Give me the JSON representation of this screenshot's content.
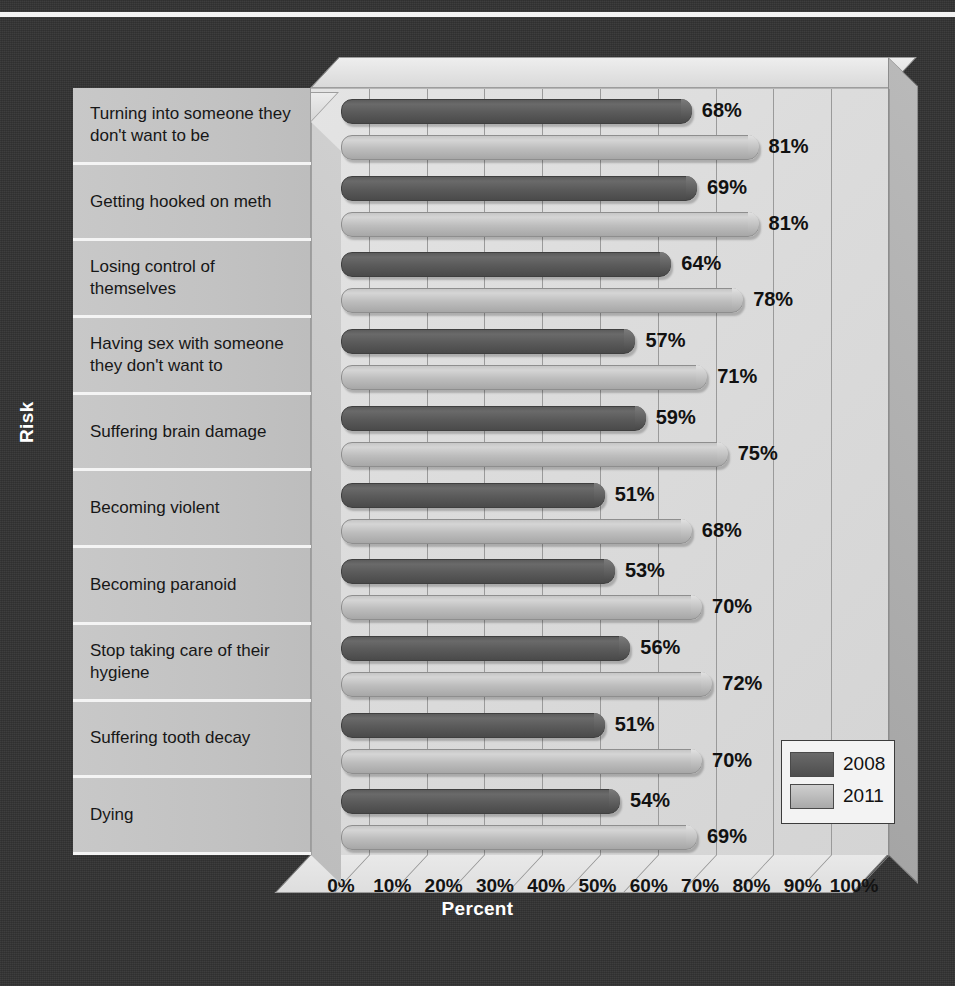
{
  "title": "",
  "axis_titles": {
    "y": "Risk",
    "x": "Percent"
  },
  "legend": {
    "entries": [
      {
        "label": "2008",
        "color": "#5a5a5a"
      },
      {
        "label": "2011",
        "color": "#bdbdbd"
      }
    ]
  },
  "xticks": [
    "0%",
    "10%",
    "20%",
    "30%",
    "40%",
    "50%",
    "60%",
    "70%",
    "80%",
    "90%",
    "100%"
  ],
  "categories": [
    "Turning into someone they don't want to be",
    "Getting hooked on meth",
    "Losing control of themselves",
    "Having sex with someone they don't want to",
    "Suffering brain damage",
    "Becoming violent",
    "Becoming paranoid",
    "Stop taking care of their hygiene",
    "Suffering tooth decay",
    "Dying"
  ],
  "bar_labels": [
    "68%",
    "81%",
    "69%",
    "81%",
    "64%",
    "78%",
    "57%",
    "71%",
    "59%",
    "75%",
    "51%",
    "68%",
    "53%",
    "70%",
    "56%",
    "72%",
    "51%",
    "70%",
    "54%",
    "69%"
  ],
  "chart_data": {
    "type": "bar",
    "orientation": "horizontal",
    "title": "",
    "xlabel": "Percent",
    "ylabel": "Risk",
    "xlim": [
      0,
      100
    ],
    "xticks": [
      0,
      10,
      20,
      30,
      40,
      50,
      60,
      70,
      80,
      90,
      100
    ],
    "grid": true,
    "legend_position": "bottom-right",
    "categories": [
      "Turning into someone they don't want to be",
      "Getting hooked on meth",
      "Losing control of themselves",
      "Having sex with someone they don't want to",
      "Suffering brain damage",
      "Becoming violent",
      "Becoming paranoid",
      "Stop taking care of their hygiene",
      "Suffering tooth decay",
      "Dying"
    ],
    "series": [
      {
        "name": "2008",
        "color": "#5a5a5a",
        "values": [
          68,
          69,
          64,
          57,
          59,
          51,
          53,
          56,
          51,
          54
        ]
      },
      {
        "name": "2011",
        "color": "#bdbdbd",
        "values": [
          81,
          81,
          78,
          71,
          75,
          68,
          70,
          72,
          70,
          69
        ]
      }
    ]
  }
}
